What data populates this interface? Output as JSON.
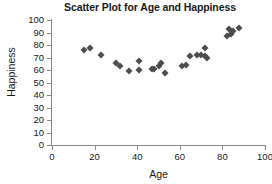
{
  "chart_data": {
    "type": "scatter",
    "title": "Scatter Plot for Age and Happiness",
    "xlabel": "Age",
    "ylabel": "Happiness",
    "xlim": [
      0,
      100
    ],
    "ylim": [
      0,
      100
    ],
    "xticks": [
      0,
      20,
      40,
      60,
      80,
      100
    ],
    "yticks": [
      0,
      10,
      20,
      30,
      40,
      50,
      60,
      70,
      80,
      90,
      100
    ],
    "grid": false,
    "legend": null,
    "marker": "diamond",
    "marker_color": "#4d4d4d",
    "series": [
      {
        "name": "Age vs Happiness",
        "points": [
          {
            "x": 15,
            "y": 76
          },
          {
            "x": 18,
            "y": 78
          },
          {
            "x": 23,
            "y": 72
          },
          {
            "x": 30,
            "y": 66
          },
          {
            "x": 32,
            "y": 63
          },
          {
            "x": 36,
            "y": 59
          },
          {
            "x": 41,
            "y": 67
          },
          {
            "x": 41,
            "y": 60
          },
          {
            "x": 47,
            "y": 61
          },
          {
            "x": 48,
            "y": 61
          },
          {
            "x": 50,
            "y": 63
          },
          {
            "x": 51,
            "y": 66
          },
          {
            "x": 53,
            "y": 58
          },
          {
            "x": 61,
            "y": 63
          },
          {
            "x": 63,
            "y": 64
          },
          {
            "x": 65,
            "y": 71
          },
          {
            "x": 68,
            "y": 72
          },
          {
            "x": 70,
            "y": 72
          },
          {
            "x": 72,
            "y": 78
          },
          {
            "x": 72,
            "y": 71
          },
          {
            "x": 73,
            "y": 70
          },
          {
            "x": 82,
            "y": 87
          },
          {
            "x": 83,
            "y": 93
          },
          {
            "x": 84,
            "y": 89
          },
          {
            "x": 85,
            "y": 91
          },
          {
            "x": 88,
            "y": 94
          }
        ]
      }
    ]
  },
  "axes": {
    "x_title": "Age",
    "y_title": "Happiness"
  }
}
